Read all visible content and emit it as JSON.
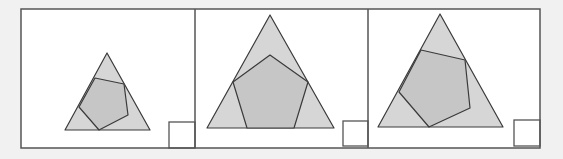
{
  "figure": {
    "colors": {
      "page_background": "#f1f1f1",
      "panel_background": "#ffffff",
      "frame_stroke": "#555555",
      "triangle_fill": "#d6d6d6",
      "pentagon_fill": "#c6c6c6",
      "shape_stroke": "#3a3a3a"
    },
    "frame": {
      "x": 21,
      "y": 9,
      "width": 519,
      "height": 139
    },
    "panels": [
      {
        "id": "panel-1",
        "x": 21,
        "width": 174,
        "triangle": "107,53 65,130 150,130",
        "pentagon": "95,78 124,84 128,115 99,130 79,107",
        "square": {
          "x": 169,
          "y": 122,
          "size": 26
        }
      },
      {
        "id": "panel-2",
        "x": 195,
        "width": 173,
        "triangle": "270,15 207,128 334,128",
        "pentagon": "270,55 308,82 294,128 247,128 233,82",
        "square": {
          "x": 343,
          "y": 121,
          "size": 25
        }
      },
      {
        "id": "panel-3",
        "x": 368,
        "width": 172,
        "triangle": "440,14 378,127 503,127",
        "pentagon": "421,50 465,60 470,108 429,127 399,92",
        "square": {
          "x": 514,
          "y": 120,
          "size": 26
        }
      }
    ]
  }
}
